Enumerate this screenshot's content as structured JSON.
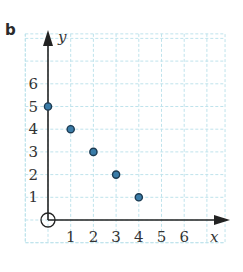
{
  "part_label": "b",
  "colors": {
    "grid": "#bfe3ec",
    "axis": "#222222",
    "point_fill": "#3a7ca8",
    "point_stroke": "#1d3b52",
    "text": "#333333"
  },
  "chart_data": {
    "type": "scatter",
    "title": "",
    "xlabel": "x",
    "ylabel": "y",
    "x_ticks": [
      1,
      2,
      3,
      4,
      5,
      6
    ],
    "y_ticks": [
      1,
      2,
      3,
      4,
      5,
      6
    ],
    "xlim": [
      -1,
      7.8
    ],
    "ylim": [
      -1,
      8.2
    ],
    "grid": true,
    "grid_style": "dashed",
    "origin_marker": "circle",
    "points": [
      {
        "x": 0,
        "y": 5
      },
      {
        "x": 1,
        "y": 4
      },
      {
        "x": 2,
        "y": 3
      },
      {
        "x": 3,
        "y": 2
      },
      {
        "x": 4,
        "y": 1
      }
    ],
    "x": [
      0,
      1,
      2,
      3,
      4
    ],
    "values": [
      5,
      4,
      3,
      2,
      1
    ]
  }
}
